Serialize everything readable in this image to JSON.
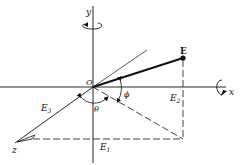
{
  "diagram": {
    "type": "coordinate-axes-vector",
    "labels": {
      "x_axis": "x",
      "y_axis": "y",
      "z_axis": "z",
      "origin": "O",
      "vector": "E",
      "component_1": "E",
      "component_1_sub": "1",
      "component_2": "E",
      "component_2_sub": "2",
      "component_3": "E",
      "component_3_sub": "3",
      "angle_theta": "θ",
      "angle_phi": "ϕ"
    },
    "colors": {
      "line": "#111111",
      "background": "#ffffff"
    }
  }
}
